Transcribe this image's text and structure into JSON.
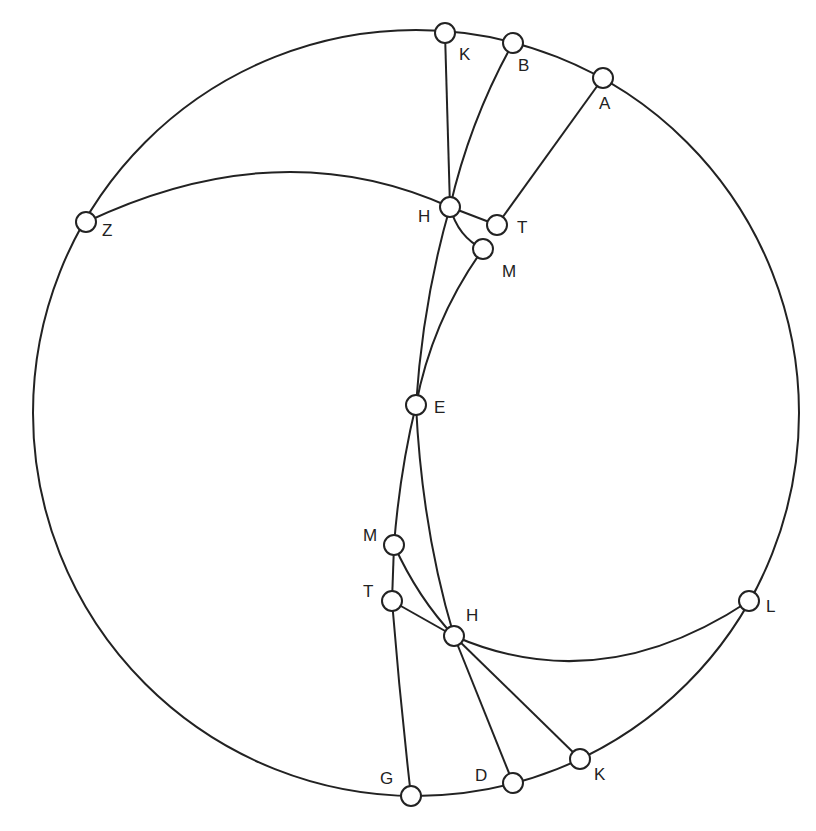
{
  "colors": {
    "stroke": "#222222",
    "background": "#ffffff"
  },
  "circle": {
    "cx": 416,
    "cy": 413,
    "r": 383
  },
  "nodes": [
    {
      "id": "K_top",
      "label": "K",
      "x": 445,
      "y": 33,
      "lx": 459,
      "ly": 60
    },
    {
      "id": "B",
      "label": "B",
      "x": 513,
      "y": 43,
      "lx": 518,
      "ly": 71
    },
    {
      "id": "A",
      "label": "A",
      "x": 603,
      "y": 78,
      "lx": 599,
      "ly": 109
    },
    {
      "id": "Z",
      "label": "Z",
      "x": 86,
      "y": 222,
      "lx": 102,
      "ly": 236
    },
    {
      "id": "H_top",
      "label": "H",
      "x": 450,
      "y": 207,
      "lx": 418,
      "ly": 222
    },
    {
      "id": "T_top",
      "label": "T",
      "x": 497,
      "y": 225,
      "lx": 517,
      "ly": 233
    },
    {
      "id": "M_top",
      "label": "M",
      "x": 483,
      "y": 249,
      "lx": 502,
      "ly": 277
    },
    {
      "id": "E",
      "label": "E",
      "x": 416,
      "y": 405,
      "lx": 434,
      "ly": 413
    },
    {
      "id": "M_bot",
      "label": "M",
      "x": 394,
      "y": 545,
      "lx": 363,
      "ly": 541
    },
    {
      "id": "T_bot",
      "label": "T",
      "x": 392,
      "y": 601,
      "lx": 363,
      "ly": 597
    },
    {
      "id": "H_bot",
      "label": "H",
      "x": 454,
      "y": 636,
      "lx": 466,
      "ly": 621
    },
    {
      "id": "L",
      "label": "L",
      "x": 749,
      "y": 601,
      "lx": 766,
      "ly": 612
    },
    {
      "id": "K_bot",
      "label": "K",
      "x": 580,
      "y": 759,
      "lx": 594,
      "ly": 780
    },
    {
      "id": "D",
      "label": "D",
      "x": 513,
      "y": 783,
      "lx": 475,
      "ly": 781
    },
    {
      "id": "G",
      "label": "G",
      "x": 411,
      "y": 796,
      "lx": 380,
      "ly": 784
    }
  ],
  "edges": [
    {
      "from": "K_top",
      "to": "H_top",
      "path": "M445,33 L450,207"
    },
    {
      "from": "B",
      "to": "H_top",
      "path": "M513,43 Q470,120 450,207"
    },
    {
      "from": "A",
      "to": "T_top",
      "path": "M603,78 L497,225"
    },
    {
      "from": "Z",
      "to": "H_top",
      "path": "M86,222 Q280,130 450,207"
    },
    {
      "from": "H_top",
      "to": "T_top",
      "path": "M450,207 L497,225"
    },
    {
      "from": "H_top",
      "to": "M_top",
      "path": "M450,207 Q458,237 483,249"
    },
    {
      "from": "H_top",
      "to": "E",
      "path": "M450,207 Q423,300 416,405"
    },
    {
      "from": "M_top",
      "to": "E",
      "path": "M483,249 Q432,320 416,405"
    },
    {
      "from": "E",
      "to": "M_bot",
      "path": "M416,405 Q400,470 394,545"
    },
    {
      "from": "E",
      "to": "H_bot",
      "path": "M416,405 Q422,530 454,636"
    },
    {
      "from": "M_bot",
      "to": "T_bot",
      "path": "M394,545 L392,601"
    },
    {
      "from": "M_bot",
      "to": "H_bot",
      "path": "M394,545 Q418,598 454,636"
    },
    {
      "from": "T_bot",
      "to": "H_bot",
      "path": "M392,601 L454,636"
    },
    {
      "from": "T_bot",
      "to": "G",
      "path": "M392,601 Q400,700 411,796"
    },
    {
      "from": "H_bot",
      "to": "L",
      "path": "M454,636 Q600,700 749,601"
    },
    {
      "from": "H_bot",
      "to": "D",
      "path": "M454,636 L513,783"
    },
    {
      "from": "H_bot",
      "to": "K_bot",
      "path": "M454,636 L580,759"
    }
  ]
}
